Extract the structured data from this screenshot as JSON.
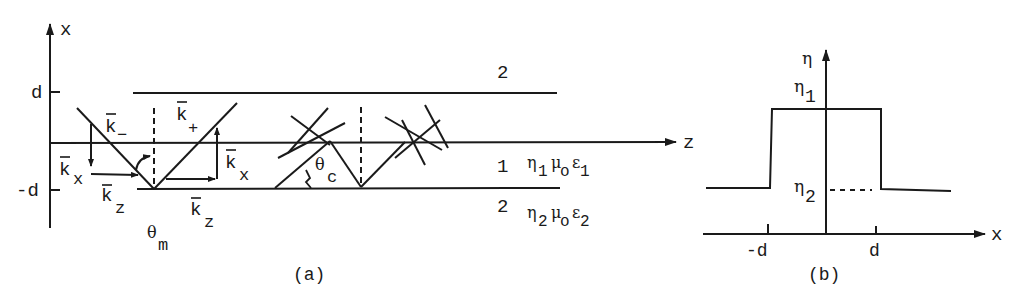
{
  "figure": {
    "panel_a": {
      "caption": "(a)",
      "axis_x_label": "x",
      "axis_z_label": "z",
      "tick_top": "d",
      "tick_bottom": "-d",
      "region_top": "2",
      "region_core": "1",
      "region_bottom": "2",
      "core_medium": {
        "eta": "η",
        "eta_sub": "1",
        "mu": "μ",
        "mu_sub": "o",
        "eps": "ε",
        "eps_sub": "1"
      },
      "clad_medium": {
        "eta": "η",
        "eta_sub": "2",
        "mu": "μ",
        "mu_sub": "o",
        "eps": "ε",
        "eps_sub": "2"
      },
      "vectors": {
        "k_minus": {
          "base": "k",
          "sub": "−"
        },
        "k_plus": {
          "base": "k",
          "sub": "+"
        },
        "k_x_left": {
          "base": "k",
          "sub": "x"
        },
        "k_z_left": {
          "base": "k",
          "sub": "z"
        },
        "k_x_right": {
          "base": "k",
          "sub": "x"
        },
        "k_z_right": {
          "base": "k",
          "sub": "z"
        }
      },
      "angle_m": {
        "base": "θ",
        "sub": "m"
      },
      "angle_c": {
        "base": "θ",
        "sub": "c"
      }
    },
    "panel_b": {
      "caption": "(b)",
      "axis_y_label": "η",
      "axis_x_label": "x",
      "level_high": {
        "base": "η",
        "sub": "1"
      },
      "level_low": {
        "base": "η",
        "sub": "2"
      },
      "tick_left": "-d",
      "tick_right": "d"
    }
  },
  "colors": {
    "ink": "#1a1a1a",
    "background": "#ffffff"
  }
}
